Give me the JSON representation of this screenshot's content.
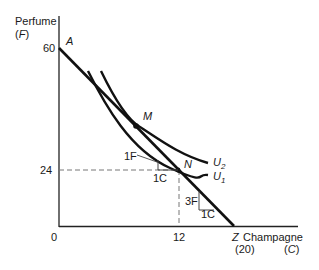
{
  "diagram": {
    "type": "indifference-curve / budget-line diagram",
    "y_axis": {
      "label": "Perfume",
      "symbol_open": "(",
      "symbol": "F",
      "symbol_close": ")",
      "ticks": [
        "60",
        "24"
      ]
    },
    "x_axis": {
      "label": "Champagne",
      "symbol_open": "(",
      "symbol": "C",
      "symbol_close": ")",
      "ticks": [
        "12"
      ],
      "intercept_label": "(20)"
    },
    "origin_label": "0",
    "points": {
      "A": {
        "label": "A",
        "C": 0,
        "F": 60
      },
      "M": {
        "label": "M"
      },
      "N": {
        "label": "N",
        "C": 12,
        "F": 24
      },
      "Z": {
        "label": "Z",
        "C": 20,
        "F": 0
      }
    },
    "curves": [
      {
        "label": "U",
        "sub": "2"
      },
      {
        "label": "U",
        "sub": "1"
      }
    ],
    "slope_annotations": {
      "mrs_at_N": {
        "rise": "1F",
        "run": "1C"
      },
      "budget_slope": {
        "rise": "3F",
        "run": "1C"
      }
    },
    "colors": {
      "line": "#111111",
      "dashed": "#777777",
      "text": "#1a1a1a"
    }
  }
}
